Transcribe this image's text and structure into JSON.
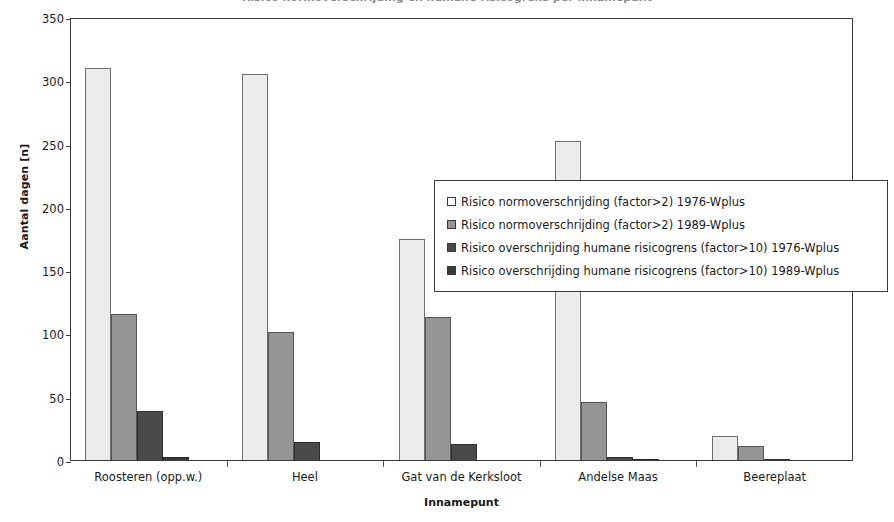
{
  "title": {
    "text": "Risico normoverschrijding en humane risicogrens per innamepunt",
    "clipped": true
  },
  "chart_data": {
    "type": "bar",
    "title": "",
    "xlabel": "Innamepunt",
    "ylabel": "Aantal dagen [n]",
    "ylim": [
      0,
      350
    ],
    "yticks": [
      0,
      50,
      100,
      150,
      200,
      250,
      300,
      350
    ],
    "grid": false,
    "legend_position": "center-right-overlay",
    "categories": [
      "Roosteren (opp.w.)",
      "Heel",
      "Gat van de Kerksloot",
      "Andelse Maas",
      "Beereplaat"
    ],
    "series": [
      {
        "name": "Risico normoverschrijding (factor>2) 1976-Wplus",
        "color": "#ebebeb",
        "values": [
          310,
          305,
          175,
          252,
          19
        ]
      },
      {
        "name": "Risico normoverschrijding (factor>2) 1989-Wplus",
        "color": "#959595",
        "values": [
          115,
          101,
          113,
          46,
          11
        ]
      },
      {
        "name": "Risico overschrijding humane risicogrens (factor>10) 1976-Wplus",
        "color": "#4a4a4a",
        "values": [
          39,
          14,
          13,
          2,
          1
        ]
      },
      {
        "name": "Risico overschrijding humane risicogrens (factor>10) 1989-Wplus",
        "color": "#3a3a3a",
        "values": [
          2,
          0,
          0,
          1,
          0
        ]
      }
    ]
  },
  "axis": {
    "ylabel": "Aantal dagen [n]",
    "xlabel": "Innamepunt",
    "yticks": [
      "0",
      "50",
      "100",
      "150",
      "200",
      "250",
      "300",
      "350"
    ]
  },
  "legend": {
    "entries": [
      {
        "label": "Risico normoverschrijding (factor>2) 1976-Wplus",
        "swatch": "#ebebeb"
      },
      {
        "label": "Risico normoverschrijding (factor>2) 1989-Wplus",
        "swatch": "#959595"
      },
      {
        "label": "Risico overschrijding humane risicogrens (factor>10) 1976-Wplus",
        "swatch": "#4a4a4a"
      },
      {
        "label": "Risico overschrijding humane risicogrens (factor>10) 1989-Wplus",
        "swatch": "#3a3a3a"
      }
    ]
  },
  "colors": {
    "series_1": "#ebebeb",
    "series_2": "#959595",
    "series_3": "#4a4a4a",
    "series_4": "#3a3a3a",
    "axis": "#3c3c3c",
    "text": "#1a1a1a",
    "background": "#ffffff"
  }
}
